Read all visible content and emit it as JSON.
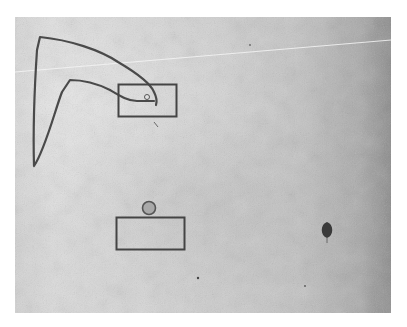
{
  "scene": {
    "type": "physics-drawing-puzzle",
    "background": {
      "style": "grungy-gray-paper",
      "color_light": "#dcdcdc",
      "color_dark": "#8a8a8a",
      "frame_color": "#ffffff"
    },
    "stroke_color": "#4a4a4a",
    "drawn_line": {
      "description": "hand-drawn bent arm/hook stroke",
      "color": "#4a4a4a"
    },
    "objects": [
      {
        "name": "upper-box",
        "shape": "rectangle",
        "outline": "#444444"
      },
      {
        "name": "small-ring-in-upper-box",
        "shape": "circle",
        "outline": "#555555"
      },
      {
        "name": "gray-ball",
        "shape": "circle",
        "fill": "#a8a8a8",
        "outline": "#555555"
      },
      {
        "name": "lower-box",
        "shape": "rectangle",
        "outline": "#444444"
      },
      {
        "name": "dark-balloon",
        "shape": "teardrop",
        "fill": "#3a3a3a"
      }
    ],
    "scratch_line_color": "#f2f2f2"
  }
}
